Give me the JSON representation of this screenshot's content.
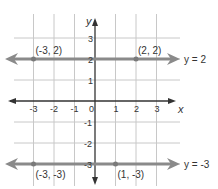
{
  "chart_data": {
    "type": "line",
    "title": "",
    "xlabel": "x",
    "ylabel": "y",
    "xlim": [
      -3,
      3
    ],
    "ylim": [
      -3,
      3
    ],
    "grid": true,
    "x_ticks": [
      "-3",
      "-2",
      "-1",
      "0",
      "1",
      "2",
      "3"
    ],
    "y_ticks": [
      "3",
      "2",
      "1",
      "-1",
      "-2",
      "-3"
    ],
    "series": [
      {
        "name": "y = 2",
        "equation": "y = 2",
        "points": [
          {
            "x": -3,
            "y": 2,
            "label": "(-3, 2)"
          },
          {
            "x": 2,
            "y": 2,
            "label": "(2, 2)"
          }
        ]
      },
      {
        "name": "y = -3",
        "equation": "y = -3",
        "points": [
          {
            "x": -3,
            "y": -3,
            "label": "(-3, -3)"
          },
          {
            "x": 1,
            "y": -3,
            "label": "(1, -3)"
          }
        ]
      }
    ]
  },
  "colors": {
    "grid": "#c8c8c8",
    "axis": "#333333",
    "line": "#8a8a8a",
    "point": "#7a7a7a",
    "text": "#333333"
  }
}
